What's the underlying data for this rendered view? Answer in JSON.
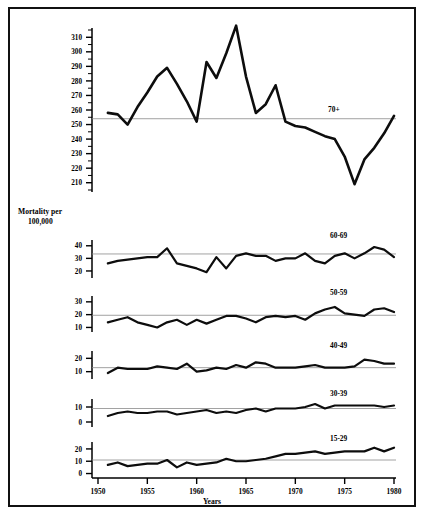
{
  "figure": {
    "title": "Mortality by age group and year",
    "y_axis_label_line1": "Mortality per",
    "y_axis_label_line2": "100,000",
    "x_axis_label": "Years",
    "border_color": "#111111",
    "line_color": "#0d0d0d",
    "reference_line_color": "#8a8a8a",
    "background": "#ffffff"
  },
  "chart_data": {
    "type": "line",
    "title": "Mortality by age group and year",
    "xlabel": "Years",
    "ylabel": "Mortality per 100,000",
    "grid": false,
    "legend": "inline-right-label-per-panel",
    "xlim": [
      1950,
      1980
    ],
    "xticks": [
      1950,
      1955,
      1960,
      1965,
      1970,
      1975,
      1980
    ],
    "x": [
      1951,
      1952,
      1953,
      1954,
      1955,
      1956,
      1957,
      1958,
      1959,
      1960,
      1961,
      1962,
      1963,
      1964,
      1965,
      1966,
      1967,
      1968,
      1969,
      1970,
      1971,
      1972,
      1973,
      1974,
      1975,
      1976,
      1977,
      1978,
      1979,
      1980
    ],
    "panels": [
      {
        "name": "70+",
        "label": "70+",
        "ylim": [
          205,
          315
        ],
        "yticks": [
          210,
          220,
          230,
          240,
          250,
          260,
          270,
          280,
          290,
          300,
          310
        ],
        "reference_value": 254,
        "values": [
          258,
          257,
          250,
          262,
          272,
          283,
          289,
          278,
          266,
          252,
          293,
          282,
          299,
          318,
          283,
          258,
          264,
          277,
          252,
          249,
          248,
          245,
          242,
          240,
          228,
          209,
          226,
          234,
          244,
          256
        ]
      },
      {
        "name": "60-69",
        "label": "60-69",
        "ylim": [
          16,
          43
        ],
        "yticks": [
          20,
          30,
          40
        ],
        "reference_value": 33.5,
        "values": [
          26,
          28,
          29,
          30,
          31,
          31,
          38,
          26,
          24,
          22,
          19,
          31,
          22,
          32,
          34,
          32,
          32,
          28,
          30,
          30,
          34,
          28,
          26,
          32,
          34,
          30,
          34,
          39,
          37,
          31
        ]
      },
      {
        "name": "50-59",
        "label": "50-59",
        "ylim": [
          8,
          33
        ],
        "yticks": [
          10,
          20,
          30
        ],
        "reference_value": 19.5,
        "values": [
          14,
          16,
          18,
          14,
          12,
          10,
          14,
          16,
          12,
          16,
          13,
          16,
          19,
          19,
          17,
          14,
          18,
          19,
          18,
          19,
          16,
          21,
          24,
          26,
          21,
          20,
          19,
          24,
          25,
          22
        ]
      },
      {
        "name": "40-49",
        "label": "40-49",
        "ylim": [
          6,
          24
        ],
        "yticks": [
          10,
          20
        ],
        "reference_value": 13,
        "values": [
          9,
          13,
          12,
          12,
          12,
          14,
          13,
          12,
          16,
          10,
          11,
          13,
          12,
          15,
          13,
          17,
          16,
          13,
          13,
          13,
          14,
          15,
          13,
          13,
          13,
          14,
          19,
          18,
          16,
          16
        ]
      },
      {
        "name": "30-39",
        "label": "30-39",
        "ylim": [
          -2,
          14
        ],
        "yticks": [
          0,
          10
        ],
        "reference_value": 9,
        "values": [
          4,
          6,
          7,
          6,
          6,
          7,
          7,
          5,
          6,
          7,
          8,
          6,
          7,
          6,
          8,
          9,
          7,
          9,
          9,
          9,
          10,
          12,
          9,
          11,
          11,
          11,
          11,
          11,
          10,
          11
        ]
      },
      {
        "name": "15-29",
        "label": "15-29",
        "ylim": [
          -2,
          24
        ],
        "yticks": [
          0,
          10,
          20
        ],
        "reference_value": 11,
        "values": [
          7,
          9,
          6,
          7,
          8,
          8,
          11,
          5,
          9,
          7,
          8,
          9,
          12,
          10,
          10,
          11,
          12,
          14,
          16,
          16,
          17,
          18,
          16,
          17,
          18,
          18,
          18,
          21,
          18,
          21
        ]
      }
    ]
  }
}
